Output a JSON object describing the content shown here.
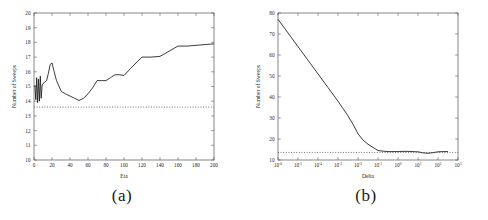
{
  "figure": {
    "panels": [
      {
        "id": "a",
        "caption": "(a)",
        "chart_data": {
          "type": "line",
          "title": "",
          "xlabel": "Eta",
          "ylabel": "Number of Sweeps",
          "xlim": [
            0,
            200
          ],
          "ylim": [
            10,
            20
          ],
          "xticks": [
            0,
            20,
            40,
            60,
            80,
            100,
            120,
            140,
            160,
            180,
            200
          ],
          "xticklabels": [
            "0",
            "20",
            "40",
            "60",
            "80",
            "100",
            "120",
            "140",
            "160",
            "180",
            "200"
          ],
          "yticks": [
            10,
            11,
            12,
            13,
            14,
            15,
            16,
            17,
            18,
            19,
            20
          ],
          "yticklabels": [
            "10",
            "11",
            "12",
            "13",
            "14",
            "15",
            "16",
            "17",
            "18",
            "19",
            "20"
          ],
          "grid": false,
          "xscale": "linear",
          "yscale": "linear",
          "legend": "none",
          "series": [
            {
              "name": "Number of Sweeps vs Eta",
              "style": "solid",
              "color": "#1a1a1a",
              "x": [
                1,
                2,
                3,
                4,
                5,
                6,
                7,
                8,
                9,
                10,
                12,
                14,
                16,
                18,
                20,
                22,
                25,
                30,
                32,
                35,
                40,
                45,
                50,
                55,
                60,
                65,
                70,
                75,
                80,
                85,
                90,
                95,
                100,
                110,
                120,
                130,
                140,
                150,
                160,
                170,
                180,
                190,
                200
              ],
              "y": [
                15.1,
                14.1,
                15.6,
                13.9,
                15.5,
                14.0,
                15.7,
                14.2,
                15.1,
                15.2,
                15.3,
                15.4,
                15.9,
                16.5,
                16.6,
                16.1,
                15.4,
                14.7,
                14.6,
                14.5,
                14.35,
                14.2,
                14.05,
                14.2,
                14.5,
                14.9,
                15.4,
                15.4,
                15.4,
                15.6,
                15.8,
                15.8,
                15.75,
                16.4,
                17.0,
                17.0,
                17.05,
                17.4,
                17.75,
                17.75,
                17.8,
                17.85,
                17.9
              ]
            },
            {
              "name": "reference baseline",
              "style": "dotted",
              "color": "#3a3a3a",
              "constant_y": 13.6
            }
          ]
        }
      },
      {
        "id": "b",
        "caption": "(b)",
        "chart_data": {
          "type": "line",
          "title": "",
          "xlabel": "Delta",
          "ylabel": "Number of Sweeps",
          "xlim": [
            -6,
            3
          ],
          "ylim": [
            10,
            80
          ],
          "xticks": [
            -6,
            -5,
            -4,
            -3,
            -2,
            -1,
            0,
            1,
            2,
            3
          ],
          "xticklabels": [
            "10-6",
            "10-5",
            "10-4",
            "10-3",
            "10-2",
            "10-1",
            "100",
            "101",
            "102",
            "103"
          ],
          "xtick_bases": [
            "10",
            "10",
            "10",
            "10",
            "10",
            "10",
            "10",
            "10",
            "10",
            "10"
          ],
          "xtick_exponents": [
            "-6",
            "-5",
            "-4",
            "-3",
            "-2",
            "-1",
            "0",
            "1",
            "2",
            "3"
          ],
          "yticks": [
            10,
            20,
            30,
            40,
            50,
            60,
            70,
            80
          ],
          "yticklabels": [
            "10",
            "20",
            "30",
            "40",
            "50",
            "60",
            "70",
            "80"
          ],
          "grid": false,
          "xscale": "log",
          "yscale": "linear",
          "legend": "none",
          "series": [
            {
              "name": "Number of Sweeps vs Delta",
              "style": "solid",
              "color": "#1a1a1a",
              "x_log10": [
                -6,
                -5.5,
                -5,
                -4.5,
                -4,
                -3.5,
                -3,
                -2.75,
                -2.5,
                -2.25,
                -2,
                -1.75,
                -1.5,
                -1.25,
                -1,
                -0.75,
                -0.5,
                -0.25,
                0,
                0.25,
                0.5,
                0.75,
                1,
                1.25,
                1.5,
                1.75,
                2,
                2.25,
                2.5
              ],
              "y": [
                77.0,
                70.5,
                64.0,
                57.5,
                51.0,
                44.5,
                38.0,
                34.5,
                31.0,
                27.0,
                22.5,
                19.5,
                17.5,
                16.0,
                14.5,
                14.2,
                14.0,
                14.0,
                14.0,
                14.1,
                14.1,
                14.0,
                13.9,
                13.4,
                13.2,
                13.5,
                13.9,
                14.0,
                14.0
              ]
            },
            {
              "name": "reference baseline",
              "style": "dotted",
              "color": "#3a3a3a",
              "constant_y": 13.6
            }
          ]
        }
      }
    ]
  }
}
